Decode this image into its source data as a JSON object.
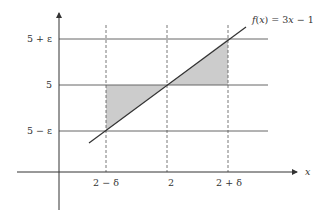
{
  "diagram": {
    "function_label": "f(x) = 3x − 1",
    "function_label_parts": {
      "f": "f",
      "x1": "x",
      "eq": ") = 3",
      "x2": "x",
      "tail": " − 1",
      "open": "("
    },
    "x_axis_label": "x",
    "y_labels": {
      "upper": "5 + ε",
      "mid": "5",
      "lower": "5 − ε"
    },
    "x_labels": {
      "left": "2 − δ",
      "mid": "2",
      "right": "2 + δ"
    },
    "colors": {
      "axis": "#333333",
      "grid": "#666666",
      "shade": "#cccccc",
      "line": "#333333"
    }
  }
}
